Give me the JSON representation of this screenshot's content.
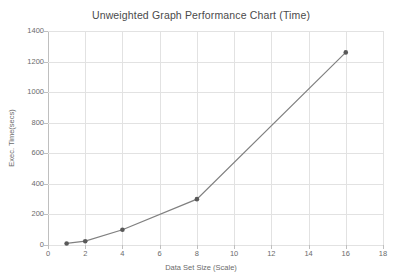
{
  "chart_data": {
    "type": "line",
    "title": "Unweighted Graph Performance Chart (Time)",
    "xlabel": "Data Set Size (Scale)",
    "ylabel": "Exec. Time(secs)",
    "x": [
      1,
      2,
      4,
      8,
      16
    ],
    "values": [
      10,
      25,
      100,
      300,
      1260
    ],
    "series": [
      {
        "name": "Exec. Time(secs)",
        "x": [
          1,
          2,
          4,
          8,
          16
        ],
        "values": [
          10,
          25,
          100,
          300,
          1260
        ]
      }
    ],
    "xlim": [
      0,
      18
    ],
    "ylim": [
      0,
      1400
    ],
    "xticks": [
      0,
      2,
      4,
      6,
      8,
      10,
      12,
      14,
      16,
      18
    ],
    "yticks": [
      0,
      200,
      400,
      600,
      800,
      1000,
      1200,
      1400
    ],
    "xtick_labels": [
      "0",
      "2",
      "4",
      "6",
      "8",
      "10",
      "12",
      "14",
      "16",
      "18"
    ],
    "ytick_labels": [
      "0",
      "200",
      "400",
      "600",
      "800",
      "1000",
      "1200",
      "1400"
    ],
    "grid": true,
    "grid_axis": "both",
    "legend": false,
    "legend_position": "none",
    "marker": "circle",
    "line_color": "#808080",
    "marker_color": "#595959",
    "grid_color": "#e2e2e2",
    "axis_color": "#bfbfbf",
    "background_color": "#ffffff",
    "text_color": "#6b6b6b",
    "title_color": "#4a4a4a"
  }
}
